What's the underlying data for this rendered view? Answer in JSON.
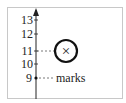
{
  "diagram": {
    "axis": {
      "ticks": [
        "13",
        "12",
        "11",
        "10",
        "9"
      ],
      "tick_values": [
        13,
        12,
        11,
        10,
        9
      ]
    },
    "circled_marker": {
      "value": 11,
      "symbol": "×"
    },
    "dot_marker": {
      "value": 9,
      "label": "marks"
    },
    "colors": {
      "axis": "#222222",
      "frame": "#c8c8c8",
      "dashes": "#555555"
    }
  }
}
